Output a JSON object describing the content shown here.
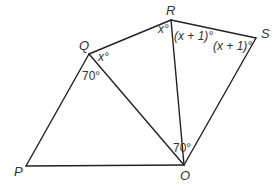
{
  "diagram": {
    "type": "geometry",
    "colors": {
      "line": "#222222",
      "text": "#333333",
      "background": "#ffffff"
    },
    "vertices": [
      {
        "id": "P",
        "label": "P",
        "x": 26,
        "y": 166
      },
      {
        "id": "Q",
        "label": "Q",
        "x": 89,
        "y": 54
      },
      {
        "id": "R",
        "label": "R",
        "x": 171,
        "y": 20
      },
      {
        "id": "S",
        "label": "S",
        "x": 256,
        "y": 38
      },
      {
        "id": "O",
        "label": "O",
        "x": 184,
        "y": 165
      }
    ],
    "edges": [
      [
        "P",
        "Q"
      ],
      [
        "Q",
        "R"
      ],
      [
        "R",
        "S"
      ],
      [
        "S",
        "O"
      ],
      [
        "O",
        "P"
      ],
      [
        "Q",
        "O"
      ],
      [
        "R",
        "O"
      ]
    ],
    "angles": [
      {
        "at": "Q",
        "between": [
          "R",
          "O"
        ],
        "label": "x°"
      },
      {
        "at": "Q",
        "between": [
          "P",
          "O"
        ],
        "label": "70°"
      },
      {
        "at": "R",
        "between": [
          "Q",
          "O"
        ],
        "label": "x°"
      },
      {
        "at": "R",
        "between": [
          "O",
          "S"
        ],
        "label": "(x + 1)°"
      },
      {
        "at": "S",
        "between": [
          "R",
          "O"
        ],
        "label": "(x + 1)°"
      },
      {
        "at": "O",
        "between": [
          "Q",
          "R"
        ],
        "label": "70°"
      }
    ]
  }
}
